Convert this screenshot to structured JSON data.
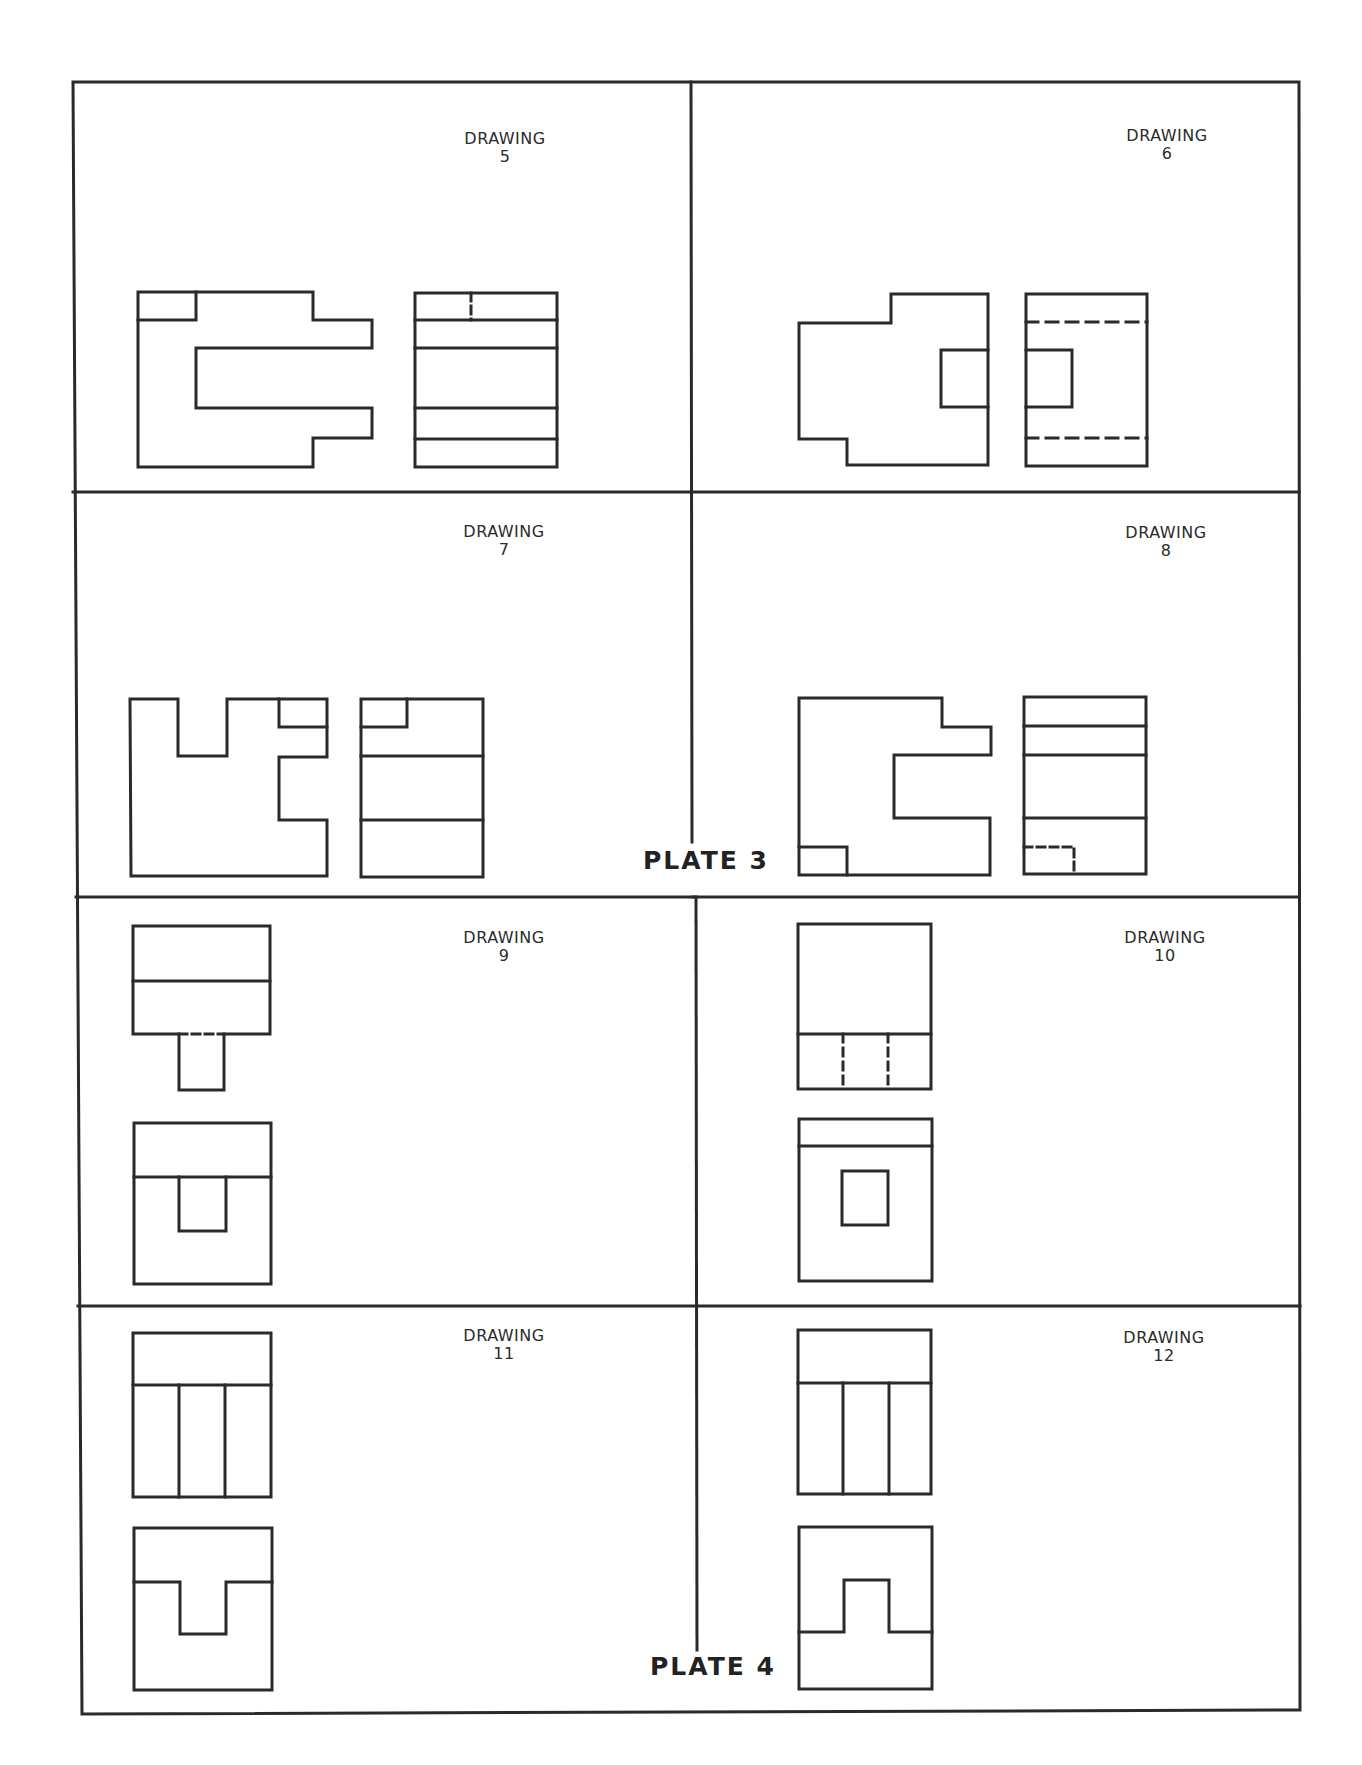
{
  "header": {
    "partial_text": ""
  },
  "plates": [
    {
      "label": "PLATE 3",
      "x": 645,
      "y": 846
    },
    {
      "label": "PLATE 4",
      "x": 652,
      "y": 1653
    }
  ],
  "drawings": [
    {
      "title": "DRAWING",
      "number": "5",
      "label_x": 505,
      "label_y": 130
    },
    {
      "title": "DRAWING",
      "number": "6",
      "label_x": 1167,
      "label_y": 127
    },
    {
      "title": "DRAWING",
      "number": "7",
      "label_x": 504,
      "label_y": 523
    },
    {
      "title": "DRAWING",
      "number": "8",
      "label_x": 1166,
      "label_y": 524
    },
    {
      "title": "DRAWING",
      "number": "9",
      "label_x": 504,
      "label_y": 929
    },
    {
      "title": "DRAWING",
      "number": "10",
      "label_x": 1165,
      "label_y": 929
    },
    {
      "title": "DRAWING",
      "number": "11",
      "label_x": 504,
      "label_y": 1327
    },
    {
      "title": "DRAWING",
      "number": "12",
      "label_x": 1164,
      "label_y": 1329
    }
  ],
  "colors": {
    "ink": "#2a2a2a",
    "paper": "#ffffff"
  }
}
